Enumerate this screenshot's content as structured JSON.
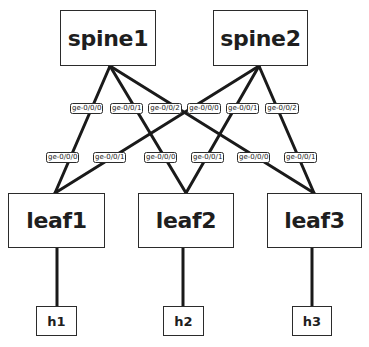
{
  "caption_fragment": "",
  "colors": {
    "line": "#1a1a1a",
    "border": "#2b2b2b",
    "text": "#1e1e1e",
    "background": "#ffffff"
  },
  "nodes": {
    "spine1": {
      "label": "spine1",
      "x": 60,
      "y": 10,
      "w": 96,
      "h": 56
    },
    "spine2": {
      "label": "spine2",
      "x": 213,
      "y": 10,
      "w": 95,
      "h": 56
    },
    "leaf1": {
      "label": "leaf1",
      "x": 8,
      "y": 193,
      "w": 97,
      "h": 55
    },
    "leaf2": {
      "label": "leaf2",
      "x": 138,
      "y": 193,
      "w": 96,
      "h": 55
    },
    "leaf3": {
      "label": "leaf3",
      "x": 267,
      "y": 193,
      "w": 95,
      "h": 55
    },
    "h1": {
      "label": "h1",
      "x": 36,
      "y": 306,
      "w": 41,
      "h": 30
    },
    "h2": {
      "label": "h2",
      "x": 163,
      "y": 306,
      "w": 41,
      "h": 30
    },
    "h3": {
      "label": "h3",
      "x": 292,
      "y": 306,
      "w": 40,
      "h": 30
    }
  },
  "ports": {
    "spine1_p0": {
      "label": "ge-0/0/0",
      "x": 70,
      "y": 103,
      "w": 33
    },
    "spine1_p1": {
      "label": "ge-0/0/1",
      "x": 110,
      "y": 103,
      "w": 33
    },
    "spine1_p2": {
      "label": "ge-0/0/2",
      "x": 148,
      "y": 103,
      "w": 34
    },
    "spine2_p0": {
      "label": "ge-0/0/0",
      "x": 187,
      "y": 103,
      "w": 34
    },
    "spine2_p1": {
      "label": "ge-0/0/1",
      "x": 226,
      "y": 103,
      "w": 33
    },
    "spine2_p2": {
      "label": "ge-0/0/2",
      "x": 265,
      "y": 103,
      "w": 34
    },
    "leaf1_p0": {
      "label": "ge-0/0/0",
      "x": 46,
      "y": 152,
      "w": 33
    },
    "leaf1_p1": {
      "label": "ge-0/0/1",
      "x": 93,
      "y": 152,
      "w": 33
    },
    "leaf2_p0": {
      "label": "ge-0/0/0",
      "x": 144,
      "y": 152,
      "w": 33
    },
    "leaf2_p1": {
      "label": "ge-0/0/1",
      "x": 191,
      "y": 152,
      "w": 33
    },
    "leaf3_p0": {
      "label": "ge-0/0/0",
      "x": 237,
      "y": 152,
      "w": 33
    },
    "leaf3_p1": {
      "label": "ge-0/0/1",
      "x": 284,
      "y": 152,
      "w": 33
    }
  },
  "links": [
    {
      "from": "spine1",
      "to": "leaf1",
      "from_port": "ge-0/0/0",
      "to_port": "ge-0/0/0"
    },
    {
      "from": "spine1",
      "to": "leaf2",
      "from_port": "ge-0/0/1",
      "to_port": "ge-0/0/0"
    },
    {
      "from": "spine1",
      "to": "leaf3",
      "from_port": "ge-0/0/2",
      "to_port": "ge-0/0/0"
    },
    {
      "from": "spine2",
      "to": "leaf1",
      "from_port": "ge-0/0/0",
      "to_port": "ge-0/0/1"
    },
    {
      "from": "spine2",
      "to": "leaf2",
      "from_port": "ge-0/0/1",
      "to_port": "ge-0/0/1"
    },
    {
      "from": "spine2",
      "to": "leaf3",
      "from_port": "ge-0/0/2",
      "to_port": "ge-0/0/1"
    },
    {
      "from": "leaf1",
      "to": "h1"
    },
    {
      "from": "leaf2",
      "to": "h2"
    },
    {
      "from": "leaf3",
      "to": "h3"
    }
  ]
}
